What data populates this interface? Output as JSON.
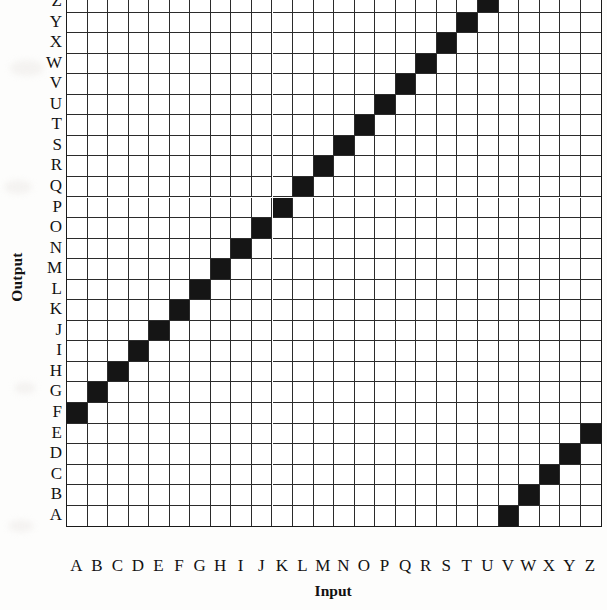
{
  "figure": {
    "x_axis_title": "Input",
    "y_axis_title": "Output",
    "x_tick_labels": [
      "A",
      "B",
      "C",
      "D",
      "E",
      "F",
      "G",
      "H",
      "I",
      "J",
      "K",
      "L",
      "M",
      "N",
      "O",
      "P",
      "Q",
      "R",
      "S",
      "T",
      "U",
      "V",
      "W",
      "X",
      "Y",
      "Z"
    ],
    "y_tick_labels": [
      "Z",
      "Y",
      "X",
      "W",
      "V",
      "U",
      "T",
      "S",
      "R",
      "Q",
      "P",
      "O",
      "N",
      "M",
      "L",
      "K",
      "J",
      "I",
      "H",
      "G",
      "F",
      "E",
      "D",
      "C",
      "B",
      "A"
    ],
    "cell_on_color": "#151515",
    "cell_off_color": "#ffffff",
    "gridline_color": "#2b2b2b",
    "border_color": "#1a1a1a"
  },
  "chart_data": {
    "type": "heatmap",
    "title": "",
    "xlabel": "Input",
    "ylabel": "Output",
    "grid": true,
    "legend": "none",
    "x": [
      "A",
      "B",
      "C",
      "D",
      "E",
      "F",
      "G",
      "H",
      "I",
      "J",
      "K",
      "L",
      "M",
      "N",
      "O",
      "P",
      "Q",
      "R",
      "S",
      "T",
      "U",
      "V",
      "W",
      "X",
      "Y",
      "Z"
    ],
    "y": [
      "A",
      "B",
      "C",
      "D",
      "E",
      "F",
      "G",
      "H",
      "I",
      "J",
      "K",
      "L",
      "M",
      "N",
      "O",
      "P",
      "Q",
      "R",
      "S",
      "T",
      "U",
      "V",
      "W",
      "X",
      "Y",
      "Z"
    ],
    "y_axis_direction": "ascending-upward",
    "xlim": [
      0,
      26
    ],
    "ylim": [
      0,
      26
    ],
    "mapping": {
      "A": "F",
      "B": "G",
      "C": "H",
      "D": "I",
      "E": "J",
      "F": "K",
      "G": "L",
      "H": "M",
      "I": "N",
      "J": "O",
      "K": "P",
      "L": "Q",
      "M": "R",
      "N": "S",
      "O": "T",
      "P": "U",
      "Q": "V",
      "R": "W",
      "S": "X",
      "T": "Y",
      "U": "Z",
      "V": "A",
      "W": "B",
      "X": "C",
      "Y": "D",
      "Z": "E"
    },
    "filled_cells": [
      {
        "input": "A",
        "output": "F"
      },
      {
        "input": "B",
        "output": "G"
      },
      {
        "input": "C",
        "output": "H"
      },
      {
        "input": "D",
        "output": "I"
      },
      {
        "input": "E",
        "output": "J"
      },
      {
        "input": "F",
        "output": "K"
      },
      {
        "input": "G",
        "output": "L"
      },
      {
        "input": "H",
        "output": "M"
      },
      {
        "input": "I",
        "output": "N"
      },
      {
        "input": "J",
        "output": "O"
      },
      {
        "input": "K",
        "output": "P"
      },
      {
        "input": "L",
        "output": "Q"
      },
      {
        "input": "M",
        "output": "R"
      },
      {
        "input": "N",
        "output": "S"
      },
      {
        "input": "O",
        "output": "T"
      },
      {
        "input": "P",
        "output": "U"
      },
      {
        "input": "Q",
        "output": "V"
      },
      {
        "input": "R",
        "output": "W"
      },
      {
        "input": "S",
        "output": "X"
      },
      {
        "input": "T",
        "output": "Y"
      },
      {
        "input": "U",
        "output": "Z"
      },
      {
        "input": "V",
        "output": "A"
      },
      {
        "input": "W",
        "output": "B"
      },
      {
        "input": "X",
        "output": "C"
      },
      {
        "input": "Y",
        "output": "D"
      },
      {
        "input": "Z",
        "output": "E"
      }
    ]
  }
}
